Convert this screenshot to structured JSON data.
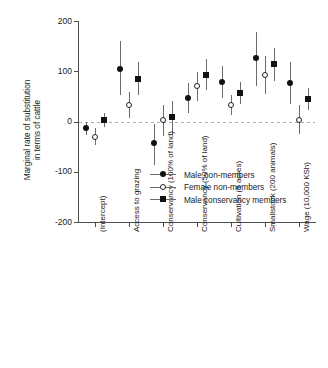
{
  "chart_data": {
    "type": "scatter",
    "title": "",
    "xlabel": "",
    "ylabel": "Marginal rate of substitution in terms of cattle",
    "ylabel_lines": [
      "Marginal rate of substitution",
      "in terms of cattle"
    ],
    "ylim": [
      -200,
      200
    ],
    "yticks": [
      200,
      100,
      0,
      -100,
      -200
    ],
    "ytick_labels": [
      "200",
      "100",
      "0",
      "-100",
      "-200"
    ],
    "grid": false,
    "zero_reference_line": true,
    "legend_position": "center-right",
    "categories": [
      "(Intercept)",
      "Access to grazing",
      "Conservancy (100% of land)",
      "Conservancy (50% of land)",
      "Cultivation (5 acres)",
      "Smallstock (200 animals)",
      "Wage (10,000 KSh)"
    ],
    "series": [
      {
        "name": "Male non-members",
        "marker": "filled-circle",
        "color": "#111111",
        "values": [
          -13,
          105,
          -43,
          46,
          78,
          126,
          76
        ],
        "ci_lower": [
          -27,
          52,
          -87,
          17,
          47,
          71,
          35
        ],
        "ci_upper": [
          0,
          160,
          -5,
          76,
          110,
          179,
          119
        ]
      },
      {
        "name": "Female non-members",
        "marker": "open-circle",
        "color": "#222222",
        "values": [
          -30,
          32,
          2,
          70,
          32,
          92,
          3
        ],
        "ci_lower": [
          -47,
          6,
          -28,
          41,
          12,
          54,
          -25
        ],
        "ci_upper": [
          -13,
          58,
          33,
          98,
          53,
          130,
          33
        ]
      },
      {
        "name": "Male conservancy members",
        "marker": "filled-square",
        "color": "#111111",
        "values": [
          3,
          85,
          8,
          93,
          57,
          114,
          44
        ],
        "ci_lower": [
          -10,
          52,
          -25,
          63,
          35,
          80,
          23
        ],
        "ci_upper": [
          16,
          119,
          41,
          124,
          78,
          147,
          66
        ]
      }
    ]
  },
  "legend": {
    "entries": [
      {
        "label": "Male non-members",
        "marker": "filled-circle"
      },
      {
        "label": "Female non-members",
        "marker": "open-circle"
      },
      {
        "label": "Male conservancy members",
        "marker": "filled-square"
      }
    ]
  }
}
